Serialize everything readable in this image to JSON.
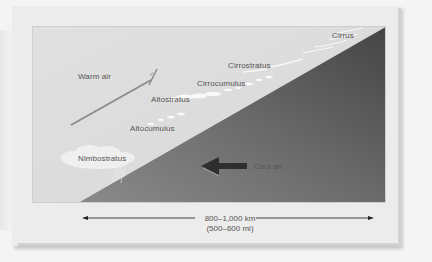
{
  "diagram": {
    "labels": {
      "warm_air": "Warm air",
      "cool_air": "Cool air",
      "cirrus": "Cirrus",
      "cirrostratus": "Cirrostratus",
      "cirrocumulus": "Cirrocumulus",
      "altostratus": "Altostratus",
      "altocumulus": "Altocumulus",
      "nimbostratus": "Nimbostratus"
    },
    "scale": {
      "km": "800–1,000 km",
      "mi": "(500–600 mi)"
    },
    "colors": {
      "warm_air_region": "#e2e2e2",
      "cool_air_wedge_light": "#9a9a9a",
      "cool_air_wedge_dark": "#4a4a4a",
      "arrow_warm": "#8a8a8a",
      "arrow_cool": "#3a3a3a",
      "text": "#555555"
    },
    "icons": {
      "warm_air_arrow": "arrow-up-right",
      "cool_air_arrow": "arrow-left",
      "scale_arrow_left": "arrow-left",
      "scale_arrow_right": "arrow-right"
    }
  }
}
